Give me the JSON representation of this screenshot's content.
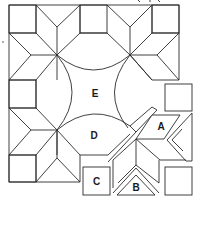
{
  "diagram": {
    "stroke_color": "#2a2a2a",
    "background": "#ffffff",
    "labels": {
      "A": "A",
      "B": "B",
      "C": "C",
      "D": "D",
      "E": "E"
    },
    "pieces": [
      {
        "id": "A",
        "shape": "parallelogram (diamond)",
        "position": "right, separated star arm"
      },
      {
        "id": "B",
        "shape": "triangle",
        "position": "bottom, under separated star"
      },
      {
        "id": "C",
        "shape": "square",
        "position": "bottom center"
      },
      {
        "id": "D",
        "shape": "arc melon / half-circle segment",
        "position": "lower middle"
      },
      {
        "id": "E",
        "shape": "curved-edge center square",
        "position": "center"
      }
    ],
    "stars": [
      "top-left",
      "top-right",
      "bottom-left",
      "bottom-right (exploded)"
    ],
    "left_margin_mark": "·"
  }
}
